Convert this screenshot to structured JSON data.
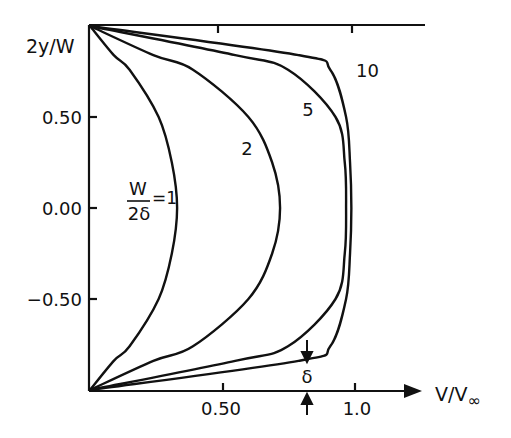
{
  "chart_data": {
    "type": "line",
    "title": "",
    "xlabel": "V/V∞",
    "ylabel": "2y/W",
    "xlim": [
      0,
      1.25
    ],
    "ylim": [
      -1.0,
      1.0
    ],
    "x_ticks": [
      "0.50",
      "1.0"
    ],
    "y_ticks": [
      "0.50",
      "0.00",
      "−0.50"
    ],
    "grid": false,
    "legend_position": "inline labels",
    "parameter_label": "W/2δ",
    "series": [
      {
        "name": "W/2δ = 1",
        "label": "1",
        "points": [
          [
            0,
            1
          ],
          [
            0.09,
            0.84
          ],
          [
            0.15,
            0.76
          ],
          [
            0.26,
            0.5
          ],
          [
            0.31,
            0.25
          ],
          [
            0.33,
            0
          ],
          [
            0.31,
            -0.25
          ],
          [
            0.26,
            -0.5
          ],
          [
            0.15,
            -0.76
          ],
          [
            0.09,
            -0.84
          ],
          [
            0,
            -1
          ]
        ]
      },
      {
        "name": "W/2δ = 2",
        "label": "2",
        "points": [
          [
            0,
            1
          ],
          [
            0.24,
            0.84
          ],
          [
            0.39,
            0.76
          ],
          [
            0.6,
            0.5
          ],
          [
            0.69,
            0.25
          ],
          [
            0.72,
            0
          ],
          [
            0.69,
            -0.25
          ],
          [
            0.6,
            -0.5
          ],
          [
            0.39,
            -0.76
          ],
          [
            0.24,
            -0.84
          ],
          [
            0,
            -1
          ]
        ]
      },
      {
        "name": "W/2δ = 5",
        "label": "5",
        "points": [
          [
            0,
            1
          ],
          [
            0.55,
            0.84
          ],
          [
            0.75,
            0.76
          ],
          [
            0.93,
            0.5
          ],
          [
            0.965,
            0.25
          ],
          [
            0.97,
            0
          ],
          [
            0.965,
            -0.25
          ],
          [
            0.93,
            -0.5
          ],
          [
            0.75,
            -0.76
          ],
          [
            0.55,
            -0.84
          ],
          [
            0,
            -1
          ]
        ]
      },
      {
        "name": "W/2δ = 10",
        "label": "10",
        "points": [
          [
            0,
            1
          ],
          [
            0.79,
            0.84
          ],
          [
            0.91,
            0.76
          ],
          [
            0.97,
            0.5
          ],
          [
            0.985,
            0.25
          ],
          [
            0.99,
            0
          ],
          [
            0.985,
            -0.25
          ],
          [
            0.97,
            -0.5
          ],
          [
            0.91,
            -0.76
          ],
          [
            0.79,
            -0.84
          ],
          [
            0,
            -1
          ]
        ]
      }
    ],
    "annotations": [
      {
        "text": "δ",
        "description": "boundary-layer thickness marker with arrows near x≈0.82 at bottom wall"
      }
    ]
  },
  "labels": {
    "ylabel": "2y/W",
    "xlabel_main": "V/V",
    "xlabel_sub": "∞",
    "yticks": [
      "0.50",
      "0.00",
      "−0.50"
    ],
    "xticks": [
      "0.50",
      "1.0"
    ],
    "param_num": "W",
    "param_den": "2δ",
    "param_eq": "=1",
    "curve2": "2",
    "curve5": "5",
    "curve10": "10",
    "delta": "δ"
  }
}
